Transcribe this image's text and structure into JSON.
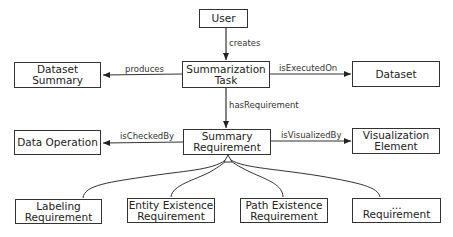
{
  "nodes": {
    "user": {
      "line1": "User",
      "line2": ""
    },
    "summarization_task": {
      "line1": "Summarization",
      "line2": "Task"
    },
    "dataset_summary": {
      "line1": "Dataset",
      "line2": "Summary"
    },
    "dataset": {
      "line1": "Dataset",
      "line2": ""
    },
    "summary_requirement": {
      "line1": "Summary",
      "line2": "Requirement"
    },
    "data_operation": {
      "line1": "Data Operation",
      "line2": ""
    },
    "visualization_element": {
      "line1": "Visualization",
      "line2": "Element"
    },
    "labeling_requirement": {
      "line1": "Labeling",
      "line2": "Requirement"
    },
    "entity_existence_requirement": {
      "line1": "Entity Existence",
      "line2": "Requirement"
    },
    "path_existence_requirement": {
      "line1": "Path Existence",
      "line2": "Requirement"
    },
    "other_requirement": {
      "line1": "...",
      "line2": "Requirement"
    }
  },
  "edges": {
    "creates": "creates",
    "produces": "produces",
    "is_executed_on": "isExecutedOn",
    "has_requirement": "hasRequirement",
    "is_checked_by": "isCheckedBy",
    "is_visualized_by": "isVisualizedBy"
  },
  "colors": {
    "stroke": "#333333",
    "text": "#222222",
    "background": "#ffffff"
  }
}
